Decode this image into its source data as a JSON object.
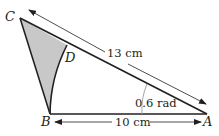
{
  "diagram": {
    "type": "geometry",
    "points": {
      "A": {
        "label": "A",
        "x": 207,
        "y": 114
      },
      "B": {
        "label": "B",
        "x": 50,
        "y": 114
      },
      "C": {
        "label": "C",
        "x": 20,
        "y": 18
      },
      "D": {
        "label": "D",
        "x": 67,
        "y": 45
      }
    },
    "measurements": {
      "CA": "13 cm",
      "BA": "10 cm",
      "angle_A": "0.6 rad"
    },
    "shaded_region": "BCD",
    "arc": "BD (centre A)",
    "colors": {
      "line": "#231f20",
      "shade": "#c8c8c8",
      "arrow": "#231f20",
      "angle_arc": "#999999"
    }
  }
}
